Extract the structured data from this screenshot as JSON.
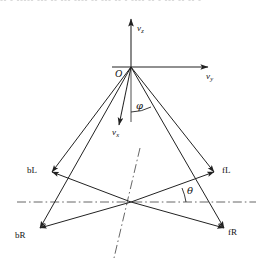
{
  "figure": {
    "type": "vector-diagram",
    "background_color": "#ffffff",
    "line_color": "#222222",
    "axis_color": "#222222",
    "dashdot_color": "#555555",
    "scan_artifact_text": "-- -  -----  --- -- ---  ---- --  --- -- -  ---- -- - --- --  -- -"
  },
  "axes": {
    "vertical": {
      "label": "v",
      "sub": "z",
      "name": "v-z-axis"
    },
    "horizontal": {
      "label": "v",
      "sub": "y",
      "name": "v-y-axis"
    },
    "depth": {
      "label": "v",
      "sub": "x",
      "name": "v-x-axis"
    },
    "origin": {
      "label": "O",
      "name": "origin-label"
    }
  },
  "angles": [
    {
      "symbol": "φ",
      "name": "phi",
      "measured_from": "v-z negative axis",
      "description": "elevation angle between downward vertical and vector"
    },
    {
      "symbol": "θ",
      "name": "theta",
      "measured_from": "horizontal dash-dot axis",
      "description": "azimuth angle between horizontal reference line and fL vector"
    }
  ],
  "vectors": [
    {
      "id": "bL",
      "label": "bL",
      "name": "vector-bL",
      "tip": "upper-left",
      "description": "back-left rotor direction"
    },
    {
      "id": "fL",
      "label": "fL",
      "name": "vector-fL",
      "tip": "upper-right",
      "description": "front-left rotor direction"
    },
    {
      "id": "bR",
      "label": "bR",
      "name": "vector-bR",
      "tip": "lower-left",
      "description": "back-right rotor direction"
    },
    {
      "id": "fR",
      "label": "fR",
      "name": "vector-fR",
      "tip": "lower-right",
      "description": "front-right rotor direction"
    }
  ],
  "reference_lines": [
    {
      "name": "horizontal-reference-line",
      "style": "dash-dot",
      "orientation": "horizontal"
    },
    {
      "name": "tilted-reference-line",
      "style": "dash-dot",
      "orientation": "tilted"
    }
  ]
}
